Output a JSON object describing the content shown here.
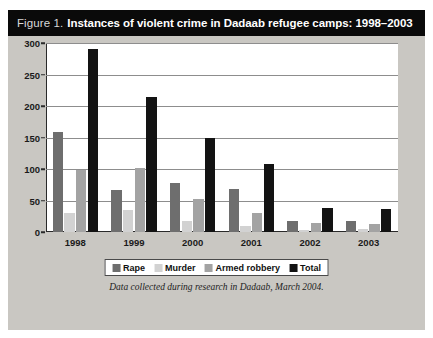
{
  "figure": {
    "label": "Figure 1.",
    "title": "Instances of violent crime in Dadaab refugee camps: 1998–2003",
    "caption": "Data collected during research in Dadaab, March 2004."
  },
  "colors": {
    "rape": "#6e6e6e",
    "murder": "#d2d2d2",
    "armed_robbery": "#a3a3a3",
    "total": "#131313",
    "title_bar": "#0a0a0a",
    "panel": "#c9c7c2",
    "plot_background": "#ffffff",
    "gridline": "#8d8d8d",
    "axis": "#2a2a2a"
  },
  "chart_data": {
    "type": "bar",
    "title": "Instances of violent crime in Dadaab refugee camps: 1998–2003",
    "xlabel": "",
    "ylabel": "",
    "categories": [
      "1998",
      "1999",
      "2000",
      "2001",
      "2002",
      "2003"
    ],
    "series": [
      {
        "name": "Rape",
        "values": [
          158,
          66,
          78,
          68,
          18,
          17
        ]
      },
      {
        "name": "Murder",
        "values": [
          30,
          35,
          18,
          10,
          3,
          4
        ]
      },
      {
        "name": "Armed robbery",
        "values": [
          98,
          102,
          52,
          30,
          14,
          13
        ]
      },
      {
        "name": "Total",
        "values": [
          290,
          215,
          150,
          108,
          38,
          36
        ]
      }
    ],
    "ylim": [
      0,
      300
    ],
    "yticks": [
      0,
      50,
      100,
      150,
      200,
      250,
      300
    ],
    "ytick_labels": [
      "0",
      "50",
      "100",
      "150",
      "200",
      "250",
      "300"
    ],
    "grid": true,
    "legend_position": "bottom",
    "legend": [
      "Rape",
      "Murder",
      "Armed robbery",
      "Total"
    ]
  }
}
